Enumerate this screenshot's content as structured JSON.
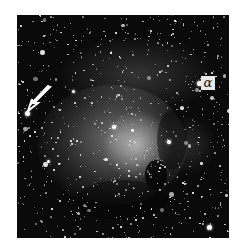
{
  "figure": {
    "labels": {
      "alpha": "α"
    },
    "annotations": [
      {
        "type": "arrow",
        "direction": "down-left",
        "points_to": "bright star left edge"
      },
      {
        "type": "label",
        "text": "α",
        "marks": "bright star upper right"
      }
    ]
  }
}
